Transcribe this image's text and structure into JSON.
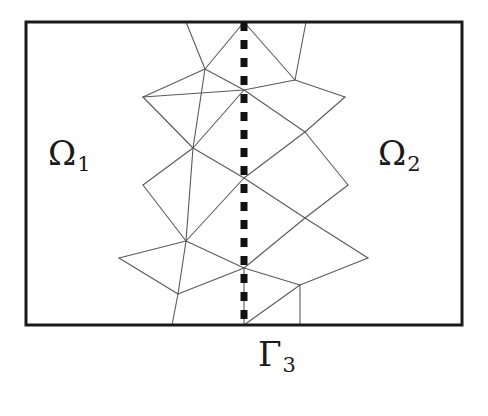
{
  "figure": {
    "type": "diagram",
    "background_color": "#ffffff",
    "frame": {
      "name": "domain-rectangle",
      "x": 26,
      "y": 22,
      "width": 436,
      "height": 303,
      "stroke_color": "#1a1a1a",
      "stroke_width": 3
    },
    "interface": {
      "name": "interface-line",
      "style": "dashed",
      "x": 244,
      "y_start": 22,
      "y_end": 325,
      "stroke_color": "#111111",
      "stroke_width": 7,
      "dash_pattern": "9 9"
    },
    "mesh": {
      "stroke_color": "#5a5a5a",
      "stroke_width": 1.1,
      "nodes": [
        {
          "id": "i0",
          "x": 244,
          "y": 22
        },
        {
          "id": "i1",
          "x": 244,
          "y": 90
        },
        {
          "id": "i2",
          "x": 244,
          "y": 178
        },
        {
          "id": "i3",
          "x": 244,
          "y": 268
        },
        {
          "id": "i4",
          "x": 244,
          "y": 325
        },
        {
          "id": "l1",
          "x": 205,
          "y": 69
        },
        {
          "id": "l2",
          "x": 193,
          "y": 148
        },
        {
          "id": "l3",
          "x": 186,
          "y": 241
        },
        {
          "id": "l4",
          "x": 178,
          "y": 294
        },
        {
          "id": "r1",
          "x": 295,
          "y": 80
        },
        {
          "id": "r2",
          "x": 305,
          "y": 132
        },
        {
          "id": "r3",
          "x": 305,
          "y": 218
        },
        {
          "id": "r4",
          "x": 300,
          "y": 285
        },
        {
          "id": "lt1",
          "x": 143,
          "y": 97
        },
        {
          "id": "lt2",
          "x": 143,
          "y": 185
        },
        {
          "id": "lt3",
          "x": 119,
          "y": 258
        },
        {
          "id": "rt1",
          "x": 345,
          "y": 97
        },
        {
          "id": "rt2",
          "x": 348,
          "y": 185
        },
        {
          "id": "rt3",
          "x": 368,
          "y": 258
        },
        {
          "id": "tl",
          "x": 186,
          "y": 22
        },
        {
          "id": "tr",
          "x": 306,
          "y": 22
        },
        {
          "id": "bl",
          "x": 172,
          "y": 325
        },
        {
          "id": "br",
          "x": 300,
          "y": 325
        }
      ],
      "edges": [
        [
          "i0",
          "l1"
        ],
        [
          "i0",
          "r1"
        ],
        [
          "i0",
          "tl"
        ],
        [
          "i0",
          "tr"
        ],
        [
          "l1",
          "tl"
        ],
        [
          "r1",
          "tr"
        ],
        [
          "l1",
          "lt1"
        ],
        [
          "l1",
          "i1"
        ],
        [
          "l1",
          "l2"
        ],
        [
          "r1",
          "i1"
        ],
        [
          "r1",
          "rt1"
        ],
        [
          "i1",
          "lt1"
        ],
        [
          "i1",
          "r2"
        ],
        [
          "lt1",
          "l2"
        ],
        [
          "l2",
          "i2"
        ],
        [
          "i1",
          "l2"
        ],
        [
          "r2",
          "rt1"
        ],
        [
          "r2",
          "i2"
        ],
        [
          "r2",
          "rt2"
        ],
        [
          "l2",
          "lt2"
        ],
        [
          "lt2",
          "l3"
        ],
        [
          "l2",
          "l3"
        ],
        [
          "i2",
          "l3"
        ],
        [
          "i2",
          "r3"
        ],
        [
          "r3",
          "rt2"
        ],
        [
          "r3",
          "i3"
        ],
        [
          "r3",
          "rt3"
        ],
        [
          "l3",
          "i3"
        ],
        [
          "l3",
          "lt3"
        ],
        [
          "l3",
          "l4"
        ],
        [
          "lt3",
          "l4"
        ],
        [
          "l4",
          "i3"
        ],
        [
          "l4",
          "bl"
        ],
        [
          "i3",
          "r4"
        ],
        [
          "i3",
          "i4"
        ],
        [
          "r4",
          "rt3"
        ],
        [
          "r4",
          "br"
        ],
        [
          "r4",
          "i4"
        ],
        [
          "i4",
          "bl"
        ],
        [
          "i4",
          "br"
        ]
      ]
    },
    "labels": {
      "omega1": {
        "base": "Ω",
        "subscript": "1"
      },
      "omega2": {
        "base": "Ω",
        "subscript": "2"
      },
      "gamma3": {
        "base": "Γ",
        "subscript": "3"
      }
    }
  }
}
